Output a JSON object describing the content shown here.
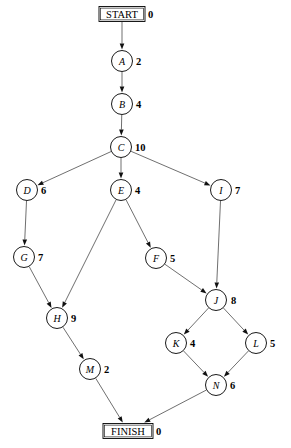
{
  "diagram": {
    "type": "directed-acyclic-graph",
    "title": "",
    "canvas": {
      "width": 291,
      "height": 448
    },
    "legend": "Each node shows its identifier and its numeric weight/value to the right.",
    "nodes": [
      {
        "id": "START",
        "label": "START",
        "weight": "0",
        "shape": "box",
        "cx": 122,
        "cy": 14,
        "r": 0,
        "box_w": 46,
        "box_h": 15,
        "weight_dx": 26
      },
      {
        "id": "A",
        "label": "A",
        "weight": "2",
        "shape": "circle",
        "cx": 122,
        "cy": 61,
        "r": 10.5,
        "weight_dx": 14
      },
      {
        "id": "B",
        "label": "B",
        "weight": "4",
        "shape": "circle",
        "cx": 122,
        "cy": 104,
        "r": 10.5,
        "weight_dx": 14
      },
      {
        "id": "C",
        "label": "C",
        "weight": "10",
        "shape": "circle",
        "cx": 121,
        "cy": 147,
        "r": 10.5,
        "weight_dx": 14
      },
      {
        "id": "D",
        "label": "D",
        "weight": "6",
        "shape": "circle",
        "cx": 27,
        "cy": 190,
        "r": 10.5,
        "weight_dx": 14
      },
      {
        "id": "E",
        "label": "E",
        "weight": "4",
        "shape": "circle",
        "cx": 121,
        "cy": 190,
        "r": 10.5,
        "weight_dx": 14
      },
      {
        "id": "I",
        "label": "I",
        "weight": "7",
        "shape": "circle",
        "cx": 221,
        "cy": 190,
        "r": 10.5,
        "weight_dx": 14
      },
      {
        "id": "G",
        "label": "G",
        "weight": "7",
        "shape": "circle",
        "cx": 24,
        "cy": 257,
        "r": 10.5,
        "weight_dx": 14
      },
      {
        "id": "F",
        "label": "F",
        "weight": "5",
        "shape": "circle",
        "cx": 156,
        "cy": 258,
        "r": 10.5,
        "weight_dx": 14
      },
      {
        "id": "J",
        "label": "J",
        "weight": "8",
        "shape": "circle",
        "cx": 216,
        "cy": 300,
        "r": 10.5,
        "weight_dx": 15
      },
      {
        "id": "H",
        "label": "H",
        "weight": "9",
        "shape": "circle",
        "cx": 57,
        "cy": 318,
        "r": 10.5,
        "weight_dx": 14
      },
      {
        "id": "K",
        "label": "K",
        "weight": "4",
        "shape": "circle",
        "cx": 176,
        "cy": 343,
        "r": 10.5,
        "weight_dx": 14
      },
      {
        "id": "L",
        "label": "L",
        "weight": "5",
        "shape": "circle",
        "cx": 256,
        "cy": 343,
        "r": 10.5,
        "weight_dx": 14
      },
      {
        "id": "M",
        "label": "M",
        "weight": "2",
        "shape": "circle",
        "cx": 90,
        "cy": 369,
        "r": 10.5,
        "weight_dx": 14
      },
      {
        "id": "N",
        "label": "N",
        "weight": "6",
        "shape": "circle",
        "cx": 216,
        "cy": 385,
        "r": 10.5,
        "weight_dx": 14
      },
      {
        "id": "FINISH",
        "label": "FINISH",
        "weight": "0",
        "shape": "box",
        "cx": 128,
        "cy": 431,
        "r": 0,
        "box_w": 50,
        "box_h": 15,
        "weight_dx": 28
      }
    ],
    "edges": [
      {
        "from": "START",
        "to": "A"
      },
      {
        "from": "A",
        "to": "B"
      },
      {
        "from": "B",
        "to": "C"
      },
      {
        "from": "C",
        "to": "D"
      },
      {
        "from": "C",
        "to": "E"
      },
      {
        "from": "C",
        "to": "I"
      },
      {
        "from": "D",
        "to": "G"
      },
      {
        "from": "E",
        "to": "H"
      },
      {
        "from": "E",
        "to": "F"
      },
      {
        "from": "I",
        "to": "J"
      },
      {
        "from": "F",
        "to": "J"
      },
      {
        "from": "G",
        "to": "H"
      },
      {
        "from": "J",
        "to": "K"
      },
      {
        "from": "J",
        "to": "L"
      },
      {
        "from": "H",
        "to": "M"
      },
      {
        "from": "K",
        "to": "N"
      },
      {
        "from": "L",
        "to": "N"
      },
      {
        "from": "M",
        "to": "FINISH"
      },
      {
        "from": "N",
        "to": "FINISH"
      }
    ],
    "colors": {
      "node_stroke": "#000000",
      "node_fill": "#ffffff",
      "edge_stroke": "#555555",
      "text": "#000000",
      "background": "#ffffff"
    }
  }
}
